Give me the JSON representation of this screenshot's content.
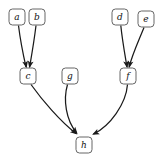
{
  "diagram": {
    "type": "directed-graph",
    "canvas": {
      "width": 163,
      "height": 160,
      "background": "#ffffff"
    },
    "style": {
      "node_shape": "rounded-rectangle",
      "node_fill": "#ffffff",
      "node_stroke": "#555555",
      "edge_stroke": "#1a1a1a",
      "label_color": "#111111",
      "node_width": 16,
      "node_height": 16,
      "node_radius": 3.5
    },
    "nodes": [
      {
        "id": "a",
        "label": "a",
        "x": 17,
        "y": 17
      },
      {
        "id": "b",
        "label": "b",
        "x": 37,
        "y": 17
      },
      {
        "id": "c",
        "label": "c",
        "x": 28,
        "y": 76
      },
      {
        "id": "d",
        "label": "d",
        "x": 120,
        "y": 17
      },
      {
        "id": "e",
        "label": "e",
        "x": 146,
        "y": 19
      },
      {
        "id": "f",
        "label": "f",
        "x": 128,
        "y": 76
      },
      {
        "id": "g",
        "label": "g",
        "x": 70,
        "y": 76
      },
      {
        "id": "h",
        "label": "h",
        "x": 84,
        "y": 145
      }
    ],
    "edges": [
      {
        "id": "a-c",
        "from": "a",
        "to": "c",
        "path": "M 18.5 25.5 C 20.5 42 23.5 56 26.0 67.0",
        "arrow": {
          "x": 26.6,
          "y": 68.2,
          "angle": 78
        }
      },
      {
        "id": "b-c",
        "from": "b",
        "to": "c",
        "path": "M 36.0 25.5 C 34.0 42 31.5 56 29.6 67.0",
        "arrow": {
          "x": 29.3,
          "y": 68.2,
          "angle": 101
        }
      },
      {
        "id": "d-f",
        "from": "d",
        "to": "f",
        "path": "M 120.8 25.5 C 122.5 42 125.2 56 127.0 67.0",
        "arrow": {
          "x": 127.3,
          "y": 68.2,
          "angle": 80
        }
      },
      {
        "id": "e-f",
        "from": "e",
        "to": "f",
        "path": "M 144.0 27.5 C 139.0 40 132.0 55 129.2 67.0",
        "arrow": {
          "x": 128.9,
          "y": 68.2,
          "angle": 103
        }
      },
      {
        "id": "c-h",
        "from": "c",
        "to": "h",
        "path": "M 31.0 84.5 C 42 100 60 121 76.0 133.5",
        "arrow": {
          "x": 77.4,
          "y": 134.6,
          "angle": 39
        }
      },
      {
        "id": "g-h",
        "from": "g",
        "to": "h",
        "path": "M 67.5 84.5 C 63 100 66 120 76.5 132.8",
        "arrow": {
          "x": 77.6,
          "y": 134.1,
          "angle": 50
        }
      },
      {
        "id": "f-h",
        "from": "f",
        "to": "h",
        "path": "M 127.5 84.5 C 126 104 110 126 93.5 134.0",
        "arrow": {
          "x": 92.1,
          "y": 134.7,
          "angle": 154
        }
      }
    ]
  }
}
